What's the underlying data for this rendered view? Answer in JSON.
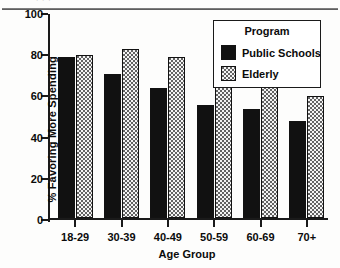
{
  "scan": {
    "top_artifact": "· ·                                                              ·"
  },
  "chart_data": {
    "type": "bar",
    "title": "",
    "xlabel": "Age Group",
    "ylabel": "% Favoring More Spending",
    "categories": [
      "18-29",
      "30-39",
      "40-49",
      "50-59",
      "60-69",
      "70+"
    ],
    "series": [
      {
        "name": "Public Schools",
        "color": "#111111",
        "values": [
          78,
          70,
          63,
          55,
          53,
          47
        ]
      },
      {
        "name": "Elderly",
        "color": "#b6b6b6",
        "values": [
          79,
          82,
          78,
          78,
          65,
          59
        ]
      }
    ],
    "legend_title": "Program",
    "legend_position": "top-right-inside",
    "ylim": [
      0,
      100
    ],
    "yticks": [
      0,
      20,
      40,
      60,
      80,
      100
    ],
    "ytick_labels": [
      "0",
      "20",
      "40",
      "60",
      "80",
      "100"
    ],
    "grid": false
  }
}
